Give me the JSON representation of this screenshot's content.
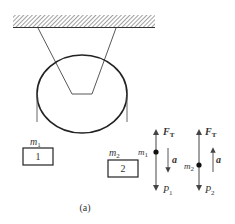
{
  "figure": {
    "caption": "(a)",
    "ceiling": {
      "hatched": true
    },
    "pulley": {
      "shape": "ellipse"
    },
    "block1": {
      "mass_label": "m",
      "mass_sub": "1",
      "number": "1"
    },
    "block2": {
      "mass_label": "m",
      "mass_sub": "2",
      "number": "2"
    },
    "fbd1": {
      "mass_label": "m",
      "mass_sub": "1",
      "tension_label": "F",
      "tension_sub": "T",
      "weight_label": "P",
      "weight_sub": "1",
      "accel_label": "a",
      "accel_direction": "down"
    },
    "fbd2": {
      "mass_label": "m",
      "mass_sub": "2",
      "tension_label": "F",
      "tension_sub": "T",
      "weight_label": "P",
      "weight_sub": "2",
      "accel_label": "a",
      "accel_direction": "up"
    }
  },
  "colors": {
    "line": "#333333",
    "arrow": "#555555"
  }
}
